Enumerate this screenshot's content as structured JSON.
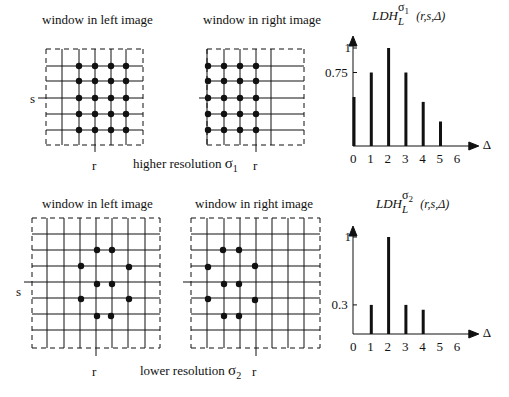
{
  "top": {
    "left_window_title": "window in left image",
    "right_window_title": "window in right image",
    "caption": "higher resolution",
    "sigma": "σ",
    "sigma_sub": "1",
    "s_label": "s",
    "r_label": "r"
  },
  "bottom": {
    "left_window_title": "window in left image",
    "right_window_title": "window in right image",
    "caption": "lower resolution",
    "sigma": "σ",
    "sigma_sub": "2",
    "s_label": "s",
    "r_label": "r"
  },
  "chart_data": [
    {
      "type": "bar",
      "title": "LDH_L^{σ1}(r,s,Δ)",
      "title_main": "LDH",
      "title_sub": "L",
      "title_sup": "σ",
      "title_sup_sub": "1",
      "title_args": "(r,s,Δ)",
      "xlabel": "Δ",
      "categories": [
        "0",
        "1",
        "2",
        "3",
        "4",
        "5",
        "6"
      ],
      "values": [
        0.5,
        0.75,
        1.0,
        0.75,
        0.45,
        0.25,
        0
      ],
      "yticks": [
        {
          "value": 1,
          "label": "1"
        },
        {
          "value": 0.75,
          "label": "0.75"
        }
      ],
      "ylim": [
        0,
        1.1
      ]
    },
    {
      "type": "bar",
      "title": "LDH_L^{σ2}(r,s,Δ)",
      "title_main": "LDH",
      "title_sub": "L",
      "title_sup": "σ",
      "title_sup_sub": "2",
      "title_args": "(r,s,Δ)",
      "xlabel": "Δ",
      "categories": [
        "0",
        "1",
        "2",
        "3",
        "4",
        "5",
        "6"
      ],
      "values": [
        0,
        0.3,
        1.0,
        0.3,
        0.25,
        0,
        0
      ],
      "yticks": [
        {
          "value": 1,
          "label": "1"
        },
        {
          "value": 0.3,
          "label": "0.3"
        }
      ],
      "ylim": [
        0,
        1.1
      ]
    }
  ]
}
